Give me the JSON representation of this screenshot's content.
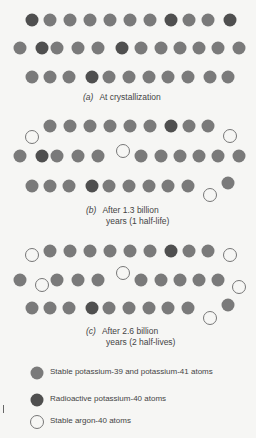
{
  "colors": {
    "stable": "#7a7a7a",
    "radioactive": "#4f4f4f",
    "argon_stroke": "#777777",
    "argon_fill": "#f6f6f4"
  },
  "panels": [
    {
      "label": "(a)",
      "caption_line1": "At crystallization",
      "caption_line2": "",
      "atoms": [
        {
          "x": 32,
          "y": 20,
          "t": "k40"
        },
        {
          "x": 50,
          "y": 20,
          "t": "k"
        },
        {
          "x": 70,
          "y": 20,
          "t": "k"
        },
        {
          "x": 90,
          "y": 20,
          "t": "k"
        },
        {
          "x": 110,
          "y": 20,
          "t": "k"
        },
        {
          "x": 130,
          "y": 20,
          "t": "k"
        },
        {
          "x": 150,
          "y": 20,
          "t": "k"
        },
        {
          "x": 171,
          "y": 20,
          "t": "k40"
        },
        {
          "x": 189,
          "y": 20,
          "t": "k"
        },
        {
          "x": 208,
          "y": 20,
          "t": "k"
        },
        {
          "x": 230,
          "y": 20,
          "t": "k40"
        },
        {
          "x": 20,
          "y": 48,
          "t": "k"
        },
        {
          "x": 42,
          "y": 48,
          "t": "k40"
        },
        {
          "x": 57,
          "y": 48,
          "t": "k"
        },
        {
          "x": 78,
          "y": 48,
          "t": "k"
        },
        {
          "x": 98,
          "y": 48,
          "t": "k"
        },
        {
          "x": 122,
          "y": 48,
          "t": "k40"
        },
        {
          "x": 141,
          "y": 48,
          "t": "k"
        },
        {
          "x": 161,
          "y": 48,
          "t": "k"
        },
        {
          "x": 180,
          "y": 48,
          "t": "k"
        },
        {
          "x": 199,
          "y": 48,
          "t": "k"
        },
        {
          "x": 218,
          "y": 48,
          "t": "k"
        },
        {
          "x": 239,
          "y": 48,
          "t": "k"
        },
        {
          "x": 32,
          "y": 77,
          "t": "k"
        },
        {
          "x": 50,
          "y": 77,
          "t": "k"
        },
        {
          "x": 69,
          "y": 77,
          "t": "k"
        },
        {
          "x": 92,
          "y": 77,
          "t": "k40"
        },
        {
          "x": 109,
          "y": 77,
          "t": "k"
        },
        {
          "x": 129,
          "y": 77,
          "t": "k"
        },
        {
          "x": 149,
          "y": 77,
          "t": "k"
        },
        {
          "x": 168,
          "y": 77,
          "t": "k"
        },
        {
          "x": 188,
          "y": 77,
          "t": "k"
        },
        {
          "x": 210,
          "y": 77,
          "t": "k"
        },
        {
          "x": 228,
          "y": 77,
          "t": "k"
        }
      ],
      "caption_x": 83,
      "caption_y": 92
    },
    {
      "label": "(b)",
      "caption_line1": "After 1.3 billion",
      "caption_line2": "years (1 half-life)",
      "atoms": [
        {
          "x": 32,
          "y": 137,
          "t": "ar"
        },
        {
          "x": 50,
          "y": 126,
          "t": "k"
        },
        {
          "x": 70,
          "y": 126,
          "t": "k"
        },
        {
          "x": 90,
          "y": 126,
          "t": "k"
        },
        {
          "x": 110,
          "y": 126,
          "t": "k"
        },
        {
          "x": 130,
          "y": 126,
          "t": "k"
        },
        {
          "x": 150,
          "y": 126,
          "t": "k"
        },
        {
          "x": 171,
          "y": 126,
          "t": "k40"
        },
        {
          "x": 189,
          "y": 126,
          "t": "k"
        },
        {
          "x": 208,
          "y": 126,
          "t": "k"
        },
        {
          "x": 230,
          "y": 136,
          "t": "ar"
        },
        {
          "x": 20,
          "y": 156,
          "t": "k"
        },
        {
          "x": 42,
          "y": 156,
          "t": "k40"
        },
        {
          "x": 57,
          "y": 156,
          "t": "k"
        },
        {
          "x": 78,
          "y": 156,
          "t": "k"
        },
        {
          "x": 98,
          "y": 156,
          "t": "k"
        },
        {
          "x": 123,
          "y": 151,
          "t": "ar"
        },
        {
          "x": 141,
          "y": 156,
          "t": "k"
        },
        {
          "x": 161,
          "y": 156,
          "t": "k"
        },
        {
          "x": 180,
          "y": 156,
          "t": "k"
        },
        {
          "x": 199,
          "y": 156,
          "t": "k"
        },
        {
          "x": 218,
          "y": 156,
          "t": "k"
        },
        {
          "x": 239,
          "y": 156,
          "t": "k"
        },
        {
          "x": 32,
          "y": 186,
          "t": "k"
        },
        {
          "x": 50,
          "y": 186,
          "t": "k"
        },
        {
          "x": 69,
          "y": 186,
          "t": "k"
        },
        {
          "x": 92,
          "y": 186,
          "t": "k40"
        },
        {
          "x": 109,
          "y": 186,
          "t": "k"
        },
        {
          "x": 129,
          "y": 186,
          "t": "k"
        },
        {
          "x": 149,
          "y": 186,
          "t": "k"
        },
        {
          "x": 168,
          "y": 186,
          "t": "k"
        },
        {
          "x": 188,
          "y": 186,
          "t": "k"
        },
        {
          "x": 210,
          "y": 195,
          "t": "ar"
        },
        {
          "x": 228,
          "y": 183,
          "t": "k"
        }
      ],
      "caption_x": 86,
      "caption_y": 205
    },
    {
      "label": "(c)",
      "caption_line1": "After 2.6 billion",
      "caption_line2": "years (2 half-lives)",
      "atoms": [
        {
          "x": 32,
          "y": 255,
          "t": "ar"
        },
        {
          "x": 50,
          "y": 251,
          "t": "k"
        },
        {
          "x": 70,
          "y": 251,
          "t": "k"
        },
        {
          "x": 90,
          "y": 251,
          "t": "k"
        },
        {
          "x": 110,
          "y": 251,
          "t": "k"
        },
        {
          "x": 130,
          "y": 251,
          "t": "k"
        },
        {
          "x": 150,
          "y": 251,
          "t": "k"
        },
        {
          "x": 171,
          "y": 251,
          "t": "k40"
        },
        {
          "x": 189,
          "y": 251,
          "t": "k"
        },
        {
          "x": 208,
          "y": 251,
          "t": "k"
        },
        {
          "x": 230,
          "y": 255,
          "t": "ar"
        },
        {
          "x": 20,
          "y": 280,
          "t": "k"
        },
        {
          "x": 42,
          "y": 285,
          "t": "ar"
        },
        {
          "x": 57,
          "y": 280,
          "t": "k"
        },
        {
          "x": 78,
          "y": 280,
          "t": "k"
        },
        {
          "x": 98,
          "y": 280,
          "t": "k"
        },
        {
          "x": 123,
          "y": 273,
          "t": "ar"
        },
        {
          "x": 141,
          "y": 280,
          "t": "k"
        },
        {
          "x": 161,
          "y": 280,
          "t": "k"
        },
        {
          "x": 180,
          "y": 280,
          "t": "k"
        },
        {
          "x": 199,
          "y": 280,
          "t": "k"
        },
        {
          "x": 218,
          "y": 280,
          "t": "k"
        },
        {
          "x": 239,
          "y": 287,
          "t": "ar"
        },
        {
          "x": 32,
          "y": 308,
          "t": "k"
        },
        {
          "x": 50,
          "y": 308,
          "t": "k"
        },
        {
          "x": 69,
          "y": 308,
          "t": "k"
        },
        {
          "x": 92,
          "y": 308,
          "t": "k40"
        },
        {
          "x": 109,
          "y": 308,
          "t": "k"
        },
        {
          "x": 129,
          "y": 308,
          "t": "k"
        },
        {
          "x": 149,
          "y": 308,
          "t": "k"
        },
        {
          "x": 168,
          "y": 308,
          "t": "k"
        },
        {
          "x": 188,
          "y": 308,
          "t": "k"
        },
        {
          "x": 210,
          "y": 318,
          "t": "ar"
        },
        {
          "x": 228,
          "y": 305,
          "t": "k"
        }
      ],
      "caption_x": 86,
      "caption_y": 326
    }
  ],
  "legend": [
    {
      "type": "k",
      "text": "Stable potassium-39 and potassium-41 atoms",
      "y": 373
    },
    {
      "type": "k40",
      "text": "Radioactive potassium-40 atoms",
      "y": 400
    },
    {
      "type": "ar",
      "text": "Stable argon-40 atoms",
      "y": 422
    }
  ]
}
